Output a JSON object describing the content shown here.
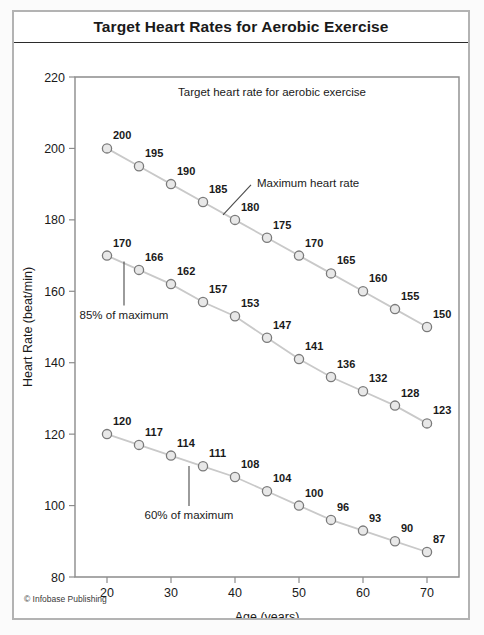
{
  "figure": {
    "title": "Target Heart Rates for Aerobic Exercise",
    "copyright": "© Infobase Publishing"
  },
  "chart_data": {
    "type": "line",
    "title": "Target Heart Rates for Aerobic Exercise",
    "subtitle": "Target heart rate for aerobic exercise",
    "xlabel": "Age (years)",
    "ylabel": "Heart Rate (beat/min)",
    "xlim": [
      15,
      75
    ],
    "ylim": [
      80,
      220
    ],
    "xticks": [
      20,
      30,
      40,
      50,
      60,
      70
    ],
    "yticks": [
      80,
      100,
      120,
      140,
      160,
      180,
      200,
      220
    ],
    "grid": false,
    "legend": "none",
    "x": [
      20,
      25,
      30,
      35,
      40,
      45,
      50,
      55,
      60,
      65,
      70
    ],
    "series": [
      {
        "name": "Maximum heart rate",
        "values": [
          200,
          195,
          190,
          185,
          180,
          175,
          170,
          165,
          160,
          155,
          150
        ]
      },
      {
        "name": "85% of maximum",
        "values": [
          170,
          166,
          162,
          157,
          153,
          147,
          141,
          136,
          132,
          128,
          123
        ]
      },
      {
        "name": "60% of maximum",
        "values": [
          120,
          117,
          114,
          111,
          108,
          104,
          100,
          96,
          93,
          90,
          87
        ]
      }
    ],
    "annotations": [
      {
        "text": "Maximum heart rate",
        "series": 0
      },
      {
        "text": "85% of maximum",
        "series": 1
      },
      {
        "text": "60% of maximum",
        "series": 2
      }
    ],
    "colors": {
      "line": "#c9c9c9",
      "marker_fill": "#e8e8e8",
      "marker_stroke": "#7a7a7a",
      "axis": "#8c8c8c",
      "text": "#1a1a1a"
    }
  }
}
